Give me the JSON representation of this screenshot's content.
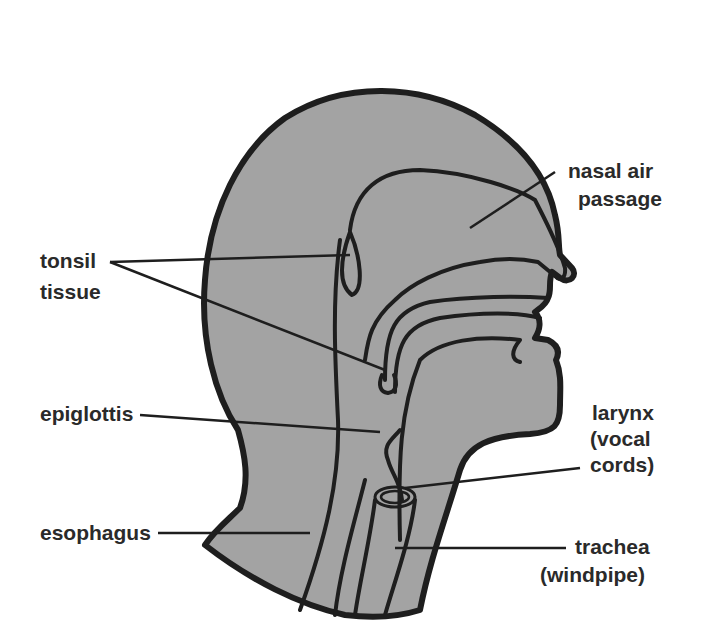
{
  "diagram": {
    "colors": {
      "fill": "#a3a3a3",
      "outline": "#1e1e1e",
      "text": "#2a2a2a",
      "background": "#ffffff"
    },
    "labels": {
      "nasal_air_passage": {
        "line1": "nasal air",
        "line2": "passage"
      },
      "tonsil_tissue": {
        "line1": "tonsil",
        "line2": "tissue"
      },
      "epiglottis": {
        "line1": "epiglottis"
      },
      "larynx": {
        "line1": "larynx",
        "line2": "(vocal",
        "line3": "cords)"
      },
      "esophagus": {
        "line1": "esophagus"
      },
      "trachea": {
        "line1": "trachea",
        "line2": "(windpipe)"
      }
    }
  }
}
